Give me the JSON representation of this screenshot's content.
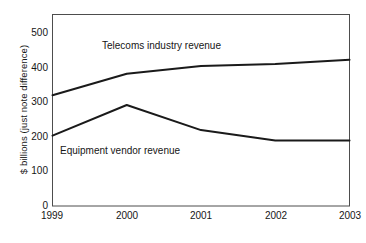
{
  "chart_data": {
    "type": "line",
    "title": "",
    "xlabel": "",
    "ylabel": "$ billions (just note difference)",
    "categories": [
      "1999",
      "2000",
      "2001",
      "2002",
      "2003"
    ],
    "x": [
      1999,
      2000,
      2001,
      2002,
      2003
    ],
    "xlim": [
      1999,
      2003
    ],
    "ylim": [
      0,
      550
    ],
    "ytick_labels": [
      "0",
      "100",
      "200",
      "300",
      "400",
      "500"
    ],
    "ytick_values": [
      0,
      100,
      200,
      300,
      400,
      500
    ],
    "grid": false,
    "legend": "inline-annotations",
    "series": [
      {
        "name": "Telecoms industry revenue",
        "values": [
          318,
          380,
          402,
          408,
          420
        ],
        "color": "#1a1a1a"
      },
      {
        "name": "Equipment vendor revenue",
        "values": [
          202,
          290,
          218,
          188,
          188
        ],
        "color": "#1a1a1a"
      }
    ],
    "annotations": [
      {
        "text": "Telecoms industry revenue"
      },
      {
        "text": "Equipment vendor revenue"
      }
    ]
  },
  "axes": {
    "y_title": "$ billions (just note difference)",
    "y_ticks": [
      "500",
      "400",
      "300",
      "200",
      "100",
      "0"
    ],
    "x_ticks": [
      "1999",
      "2000",
      "2001",
      "2002",
      "2003"
    ]
  },
  "labels": {
    "telecoms": "Telecoms industry revenue",
    "equipment": "Equipment vendor revenue"
  },
  "colors": {
    "line": "#1a1a1a",
    "frame": "#4d4d4d",
    "background": "#ffffff",
    "text": "#161616"
  }
}
